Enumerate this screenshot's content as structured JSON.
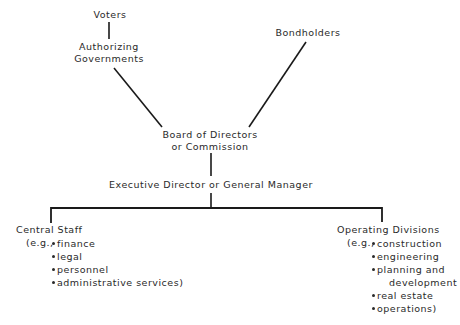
{
  "nodes": {
    "voters": "Voters",
    "authorizing_governments": [
      "Authorizing",
      "Governments"
    ],
    "bondholders": "Bondholders",
    "board": [
      "Board of Directors",
      "or Commission"
    ],
    "executive": "Executive Director or General Manager",
    "central_staff": {
      "title": "Central Staff",
      "prefix": "(e.g.,",
      "items": [
        "finance",
        "legal",
        "personnel",
        "administrative services)"
      ]
    },
    "operating_divisions": {
      "title": "Operating Divisions",
      "prefix": "(e.g.,",
      "items": [
        "construction",
        "engineering",
        "planning and",
        "real estate",
        "operations)"
      ],
      "continuation": "development"
    }
  },
  "colors": {
    "line": "#1a1a1a",
    "text": "#2a2a2a",
    "background": "#ffffff"
  }
}
